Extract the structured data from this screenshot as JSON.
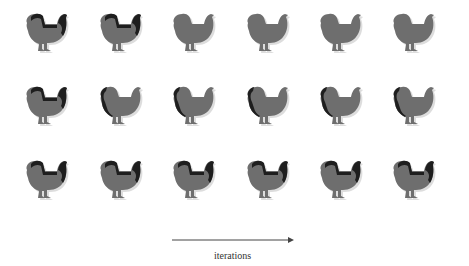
{
  "figure": {
    "rows": 3,
    "columns": 6,
    "colors": {
      "body": "#6e6e6e",
      "shadow": "#1e1e1e",
      "ghost": "#d4d4d4"
    },
    "cells": [
      [
        {
          "variant": "dark-back"
        },
        {
          "variant": "dark-back"
        },
        {
          "variant": "plain"
        },
        {
          "variant": "plain"
        },
        {
          "variant": "plain"
        },
        {
          "variant": "plain"
        }
      ],
      [
        {
          "variant": "dark-back"
        },
        {
          "variant": "dark-edge"
        },
        {
          "variant": "dark-edge"
        },
        {
          "variant": "dark-edge"
        },
        {
          "variant": "dark-edge"
        },
        {
          "variant": "dark-edge"
        }
      ],
      [
        {
          "variant": "dark-back"
        },
        {
          "variant": "dark-back"
        },
        {
          "variant": "dark-back"
        },
        {
          "variant": "dark-back"
        },
        {
          "variant": "dark-back"
        },
        {
          "variant": "dark-back"
        }
      ]
    ]
  },
  "axis": {
    "label": "iterations",
    "arrow_direction": "right"
  }
}
